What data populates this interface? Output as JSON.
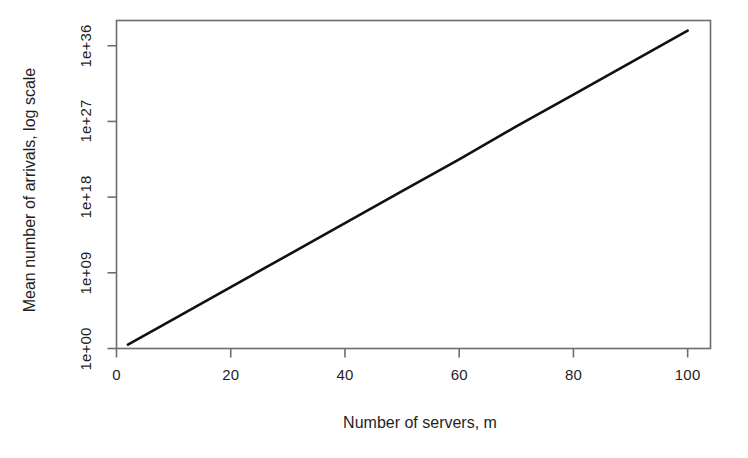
{
  "chart_data": {
    "type": "line",
    "title": "",
    "subtitle": "",
    "xlabel": "Number of servers, m",
    "ylabel": "Mean number of arrivals, log scale",
    "xlim": [
      0,
      104
    ],
    "ylim_exponent": [
      0,
      39
    ],
    "y_scale": "log",
    "grid": false,
    "legend": null,
    "annotations": [],
    "xticks": [
      {
        "value": 0,
        "label": "0"
      },
      {
        "value": 20,
        "label": "20"
      },
      {
        "value": 40,
        "label": "40"
      },
      {
        "value": 60,
        "label": "60"
      },
      {
        "value": 80,
        "label": "80"
      },
      {
        "value": 100,
        "label": "100"
      }
    ],
    "yticks": [
      {
        "exponent": 0,
        "label": "1e+00"
      },
      {
        "exponent": 9,
        "label": "1e+09"
      },
      {
        "exponent": 18,
        "label": "1e+18"
      },
      {
        "exponent": 27,
        "label": "1e+27"
      },
      {
        "exponent": 36,
        "label": "1e+36"
      }
    ],
    "series": [
      {
        "name": "Mean number of arrivals",
        "color": "#111111",
        "line_width": 2.6,
        "x": [
          2,
          10,
          20,
          30,
          40,
          50,
          60,
          70,
          80,
          90,
          100
        ],
        "y_log10": [
          0.45,
          3.5,
          7.3,
          11.1,
          14.9,
          18.7,
          22.5,
          26.4,
          30.2,
          34.0,
          37.8
        ],
        "y": [
          "2.8e+00",
          "3.2e+03",
          "2.0e+07",
          "1.3e+11",
          "7.9e+14",
          "5.0e+18",
          "3.2e+22",
          "2.5e+26",
          "1.6e+30",
          "1.0e+34",
          "6.3e+37"
        ]
      }
    ]
  },
  "style": {
    "background": "#ffffff",
    "axis_color": "#6d6d6d",
    "text_color": "#1f1f1f",
    "line_color": "#111111"
  }
}
